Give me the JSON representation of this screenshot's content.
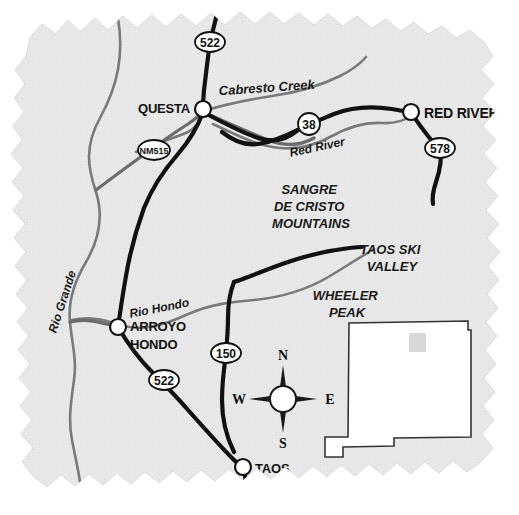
{
  "map": {
    "title": "Taos Area Road Map",
    "paper_fill": "#e9e9e9",
    "paper_edge": "#dcdcdc",
    "road_color": "#111111",
    "secondary_road_color": "#6b6b6b",
    "river_color": "#7a7a7a",
    "towns": [
      {
        "id": "questa",
        "label": "QUESTA",
        "x": 203,
        "y": 109,
        "label_x": 190,
        "label_y": 113,
        "anchor": "end",
        "size": 13
      },
      {
        "id": "red-river",
        "label": "RED RIVER",
        "x": 411,
        "y": 112,
        "label_x": 424,
        "label_y": 118,
        "anchor": "start",
        "size": 14
      },
      {
        "id": "arroyo-hondo",
        "label": "ARROYO",
        "label2": "HONDO",
        "x": 118,
        "y": 327,
        "label_x": 130,
        "label_y": 331,
        "label2_y": 349,
        "anchor": "start",
        "size": 13
      },
      {
        "id": "taos",
        "label": "TAOS",
        "x": 243,
        "y": 467,
        "label_x": 255,
        "label_y": 473,
        "anchor": "start",
        "size": 13
      }
    ],
    "highway_shields": [
      {
        "id": "522-north",
        "number": "522",
        "x": 210,
        "y": 42,
        "shape": "oval",
        "rx": 15,
        "ry": 10
      },
      {
        "id": "nm-515",
        "number": "NM515",
        "x": 154,
        "y": 150,
        "shape": "oval",
        "rx": 16,
        "ry": 10,
        "size": 9
      },
      {
        "id": "38",
        "number": "38",
        "x": 309,
        "y": 124,
        "shape": "circle",
        "rx": 11,
        "ry": 11
      },
      {
        "id": "578",
        "number": "578",
        "x": 440,
        "y": 148,
        "shape": "oval",
        "rx": 15,
        "ry": 10
      },
      {
        "id": "150",
        "number": "150",
        "x": 226,
        "y": 353,
        "shape": "oval",
        "rx": 15,
        "ry": 10
      },
      {
        "id": "522-south",
        "number": "522",
        "x": 164,
        "y": 380,
        "shape": "oval",
        "rx": 15,
        "ry": 10
      }
    ],
    "water_labels": [
      {
        "id": "cabresto-creek",
        "text": "Cabresto Creek",
        "x": 267,
        "y": 92,
        "rotate": -4,
        "size": 13
      },
      {
        "id": "red-river-water",
        "text": "Red River",
        "x": 318,
        "y": 151,
        "rotate": -12,
        "size": 12
      },
      {
        "id": "rio-grande",
        "text": "Rio Grande",
        "x": 66,
        "y": 303,
        "rotate": -72,
        "size": 12
      },
      {
        "id": "rio-hondo",
        "text": "Rio Hondo",
        "x": 160,
        "y": 312,
        "rotate": -11,
        "size": 12
      }
    ],
    "area_labels": [
      {
        "id": "sangre-de-cristo",
        "lines": [
          "SANGRE",
          "DE CRISTO",
          "MOUNTAINS"
        ],
        "x": 311,
        "y": 194,
        "size": 13,
        "line_height": 17
      },
      {
        "id": "taos-ski-valley",
        "lines": [
          "TAOS SKI",
          "VALLEY"
        ],
        "x": 392,
        "y": 254,
        "size": 13,
        "line_height": 17
      },
      {
        "id": "wheeler-peak",
        "lines": [
          "WHEELER",
          "PEAK"
        ],
        "x": 347,
        "y": 300,
        "size": 13,
        "line_height": 17
      }
    ],
    "compass": {
      "cx": 283,
      "cy": 399,
      "radius": 13,
      "arm": 34,
      "north": "N",
      "east": "E",
      "south": "S",
      "west": "W",
      "letter_size": 14
    },
    "inset": {
      "id": "new-mexico-inset",
      "name": "New Mexico state outline",
      "fill": "#ffffff",
      "stroke": "#333333",
      "highlight_fill": "#d8d8d8",
      "highlight": {
        "x": 409,
        "y": 333,
        "w": 17,
        "h": 19
      }
    }
  }
}
